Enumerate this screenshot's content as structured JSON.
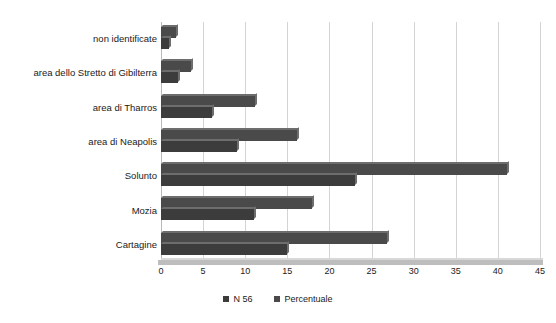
{
  "chart_data": {
    "type": "bar",
    "orientation": "horizontal",
    "title": "",
    "xlabel": "",
    "ylabel": "",
    "xlim": [
      0,
      45
    ],
    "xticks": [
      0,
      5,
      10,
      15,
      20,
      25,
      30,
      35,
      40,
      45
    ],
    "grid": true,
    "legend_position": "bottom",
    "categories": [
      "non identificate",
      "area dello Stretto di Gibilterra",
      "area di Tharros",
      "area di Neapolis",
      "Solunto",
      "Mozia",
      "Cartagine"
    ],
    "series": [
      {
        "name": "N 56",
        "color": "#3c3c3c",
        "values": [
          1,
          2,
          6,
          9,
          23,
          11,
          15
        ]
      },
      {
        "name": "Percentuale",
        "color": "#4a4a4a",
        "values": [
          1.8,
          3.6,
          11.2,
          16.1,
          41.1,
          17.9,
          26.8
        ]
      }
    ]
  },
  "legend": {
    "items": [
      {
        "label": "N 56",
        "color": "#3c3c3c"
      },
      {
        "label": "Percentuale",
        "color": "#4a4a4a"
      }
    ]
  }
}
